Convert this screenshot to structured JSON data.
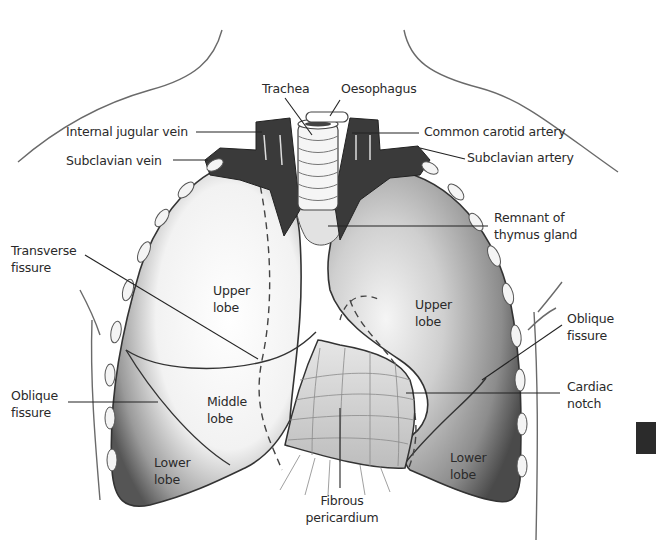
{
  "diagram": {
    "colors": {
      "ink": "#2a2a2a",
      "vessel_dark": "#3a3a3a",
      "lung_shade": "#8a8a8a",
      "background": "#ffffff"
    },
    "labels": {
      "trachea": "Trachea",
      "oesophagus": "Oesophagus",
      "internal_jugular_vein": "Internal jugular vein",
      "common_carotid_artery": "Common carotid artery",
      "subclavian_vein": "Subclavian vein",
      "subclavian_artery": "Subclavian artery",
      "remnant_of_thymus_gland": "Remnant of\nthymus gland",
      "transverse_fissure": "Transverse\nfissure",
      "right_upper_lobe": "Upper\nlobe",
      "left_upper_lobe": "Upper\nlobe",
      "oblique_fissure_right": "Oblique\nfissure",
      "oblique_fissure_left": "Oblique\nfissure",
      "middle_lobe": "Middle\nlobe",
      "cardiac_notch": "Cardiac\nnotch",
      "right_lower_lobe": "Lower\nlobe",
      "left_lower_lobe": "Lower\nlobe",
      "fibrous_pericardium": "Fibrous\npericardium"
    }
  }
}
